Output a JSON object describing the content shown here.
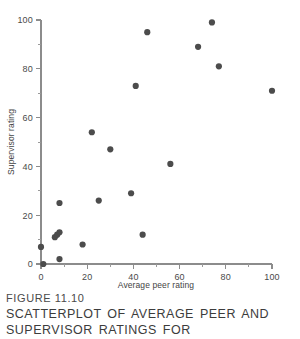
{
  "figure": {
    "number_label": "FIGURE 11.10",
    "caption_lines": [
      "SCATTERPLOT OF AVERAGE PEER AND",
      "SUPERVISOR RATINGS FOR"
    ]
  },
  "colors": {
    "point": "#4c4c4c",
    "axis": "#8c8c8c",
    "text": "#3c3c3c",
    "background": "#ffffff"
  },
  "chart_data": {
    "type": "scatter",
    "title": "",
    "xlabel": "Average peer rating",
    "ylabel": "Supervisor rating",
    "xlim": [
      0,
      100
    ],
    "ylim": [
      0,
      100
    ],
    "xticks": [
      0,
      20,
      40,
      60,
      80,
      100
    ],
    "xtick_labels": [
      "0",
      "20",
      "40",
      "60",
      "80",
      "100"
    ],
    "xminorticks": [
      10,
      30,
      50,
      70,
      90
    ],
    "yticks": [
      0,
      20,
      40,
      60,
      80,
      100
    ],
    "ytick_labels": [
      "0",
      "20",
      "40",
      "60",
      "80",
      "100"
    ],
    "yminorticks": [
      10,
      30,
      50,
      70,
      90
    ],
    "grid": false,
    "legend": null,
    "marker": "circle",
    "marker_size": 3.1,
    "points": [
      {
        "x": 0,
        "y": 7
      },
      {
        "x": 1,
        "y": 0
      },
      {
        "x": 6,
        "y": 11
      },
      {
        "x": 7,
        "y": 12
      },
      {
        "x": 8,
        "y": 13
      },
      {
        "x": 8,
        "y": 25
      },
      {
        "x": 8,
        "y": 2
      },
      {
        "x": 18,
        "y": 8
      },
      {
        "x": 22,
        "y": 54
      },
      {
        "x": 25,
        "y": 26
      },
      {
        "x": 30,
        "y": 47
      },
      {
        "x": 39,
        "y": 29
      },
      {
        "x": 41,
        "y": 73
      },
      {
        "x": 44,
        "y": 12
      },
      {
        "x": 46,
        "y": 95
      },
      {
        "x": 56,
        "y": 41
      },
      {
        "x": 68,
        "y": 89
      },
      {
        "x": 74,
        "y": 99
      },
      {
        "x": 77,
        "y": 81
      },
      {
        "x": 100,
        "y": 71
      }
    ]
  }
}
